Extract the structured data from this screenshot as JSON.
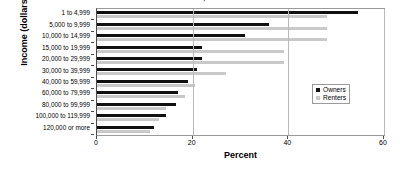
{
  "chart_data": {
    "type": "bar",
    "orientation": "horizontal",
    "title": "Income, 2013",
    "xlabel": "Percent",
    "ylabel": "Income (dollars)",
    "xlim": [
      0,
      60
    ],
    "xticks": [
      0,
      20,
      40,
      60
    ],
    "grid": true,
    "legend_position": "right",
    "categories": [
      "1 to 4,999",
      "5,000 to 9,999",
      "10,000 to 14,999",
      "15,000 to 19,999",
      "20,000 to 29,999",
      "30,000 to 39,999",
      "40,000 to 59,999",
      "60,000 to 79,999",
      "80,000 to 99,999",
      "100,000 to 119,999",
      "120,000 or more"
    ],
    "series": [
      {
        "name": "Owners",
        "color": "#111111",
        "values": [
          54.5,
          36.0,
          31.0,
          22.0,
          22.0,
          21.0,
          19.0,
          17.0,
          16.5,
          14.5,
          12.0
        ]
      },
      {
        "name": "Renters",
        "color": "#c9c9c9",
        "values": [
          48.0,
          48.0,
          48.0,
          39.0,
          39.0,
          27.0,
          20.5,
          18.5,
          14.5,
          13.0,
          11.0
        ]
      }
    ]
  },
  "legend": {
    "items": [
      {
        "label": "Owners"
      },
      {
        "label": "Renters"
      }
    ]
  }
}
